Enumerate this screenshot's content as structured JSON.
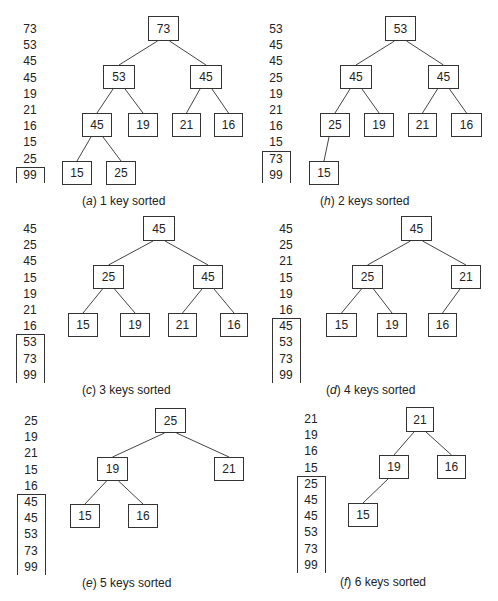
{
  "figure": {
    "panels": [
      {
        "id": "a",
        "caption_label": "(a)",
        "caption_text": "1 key sorted",
        "array": [
          "73",
          "53",
          "45",
          "45",
          "19",
          "21",
          "16",
          "15",
          "25",
          "99"
        ],
        "sorted_count": 1,
        "tree": [
          {
            "v": "73",
            "x": 148,
            "y": 16,
            "w": 31,
            "h": 25
          },
          {
            "v": "53",
            "x": 103,
            "y": 65,
            "w": 32,
            "h": 24
          },
          {
            "v": "45",
            "x": 190,
            "y": 65,
            "w": 32,
            "h": 24
          },
          {
            "v": "45",
            "x": 82,
            "y": 113,
            "w": 30,
            "h": 24
          },
          {
            "v": "19",
            "x": 128,
            "y": 113,
            "w": 30,
            "h": 24
          },
          {
            "v": "21",
            "x": 172,
            "y": 113,
            "w": 29,
            "h": 24
          },
          {
            "v": "16",
            "x": 214,
            "y": 113,
            "w": 29,
            "h": 24
          },
          {
            "v": "15",
            "x": 62,
            "y": 161,
            "w": 30,
            "h": 24
          },
          {
            "v": "25",
            "x": 106,
            "y": 161,
            "w": 30,
            "h": 24
          }
        ],
        "edges": [
          [
            0,
            1
          ],
          [
            0,
            2
          ],
          [
            1,
            3
          ],
          [
            1,
            4
          ],
          [
            2,
            5
          ],
          [
            2,
            6
          ],
          [
            3,
            7
          ],
          [
            3,
            8
          ]
        ]
      },
      {
        "id": "b",
        "caption_label": "(h)",
        "caption_text": "2 keys sorted",
        "array": [
          "53",
          "45",
          "45",
          "25",
          "19",
          "21",
          "16",
          "15",
          "73",
          "99"
        ],
        "sorted_count": 2,
        "tree": [
          {
            "v": "53",
            "x": 385,
            "y": 16,
            "w": 31,
            "h": 25
          },
          {
            "v": "45",
            "x": 340,
            "y": 65,
            "w": 32,
            "h": 24
          },
          {
            "v": "45",
            "x": 428,
            "y": 65,
            "w": 31,
            "h": 24
          },
          {
            "v": "25",
            "x": 320,
            "y": 113,
            "w": 30,
            "h": 24
          },
          {
            "v": "19",
            "x": 364,
            "y": 113,
            "w": 30,
            "h": 24
          },
          {
            "v": "21",
            "x": 408,
            "y": 113,
            "w": 29,
            "h": 24
          },
          {
            "v": "16",
            "x": 451,
            "y": 113,
            "w": 31,
            "h": 24
          },
          {
            "v": "15",
            "x": 309,
            "y": 161,
            "w": 30,
            "h": 24
          }
        ],
        "edges": [
          [
            0,
            1
          ],
          [
            0,
            2
          ],
          [
            1,
            3
          ],
          [
            1,
            4
          ],
          [
            2,
            5
          ],
          [
            2,
            6
          ],
          [
            3,
            7
          ]
        ]
      },
      {
        "id": "c",
        "caption_label": "(c)",
        "caption_text": "3 keys sorted",
        "array": [
          "45",
          "25",
          "45",
          "15",
          "19",
          "21",
          "16",
          "53",
          "73",
          "99"
        ],
        "sorted_count": 3,
        "tree": [
          {
            "v": "45",
            "x": 143,
            "y": 216,
            "w": 32,
            "h": 25
          },
          {
            "v": "25",
            "x": 93,
            "y": 265,
            "w": 31,
            "h": 24
          },
          {
            "v": "45",
            "x": 193,
            "y": 265,
            "w": 30,
            "h": 24
          },
          {
            "v": "15",
            "x": 68,
            "y": 313,
            "w": 30,
            "h": 24
          },
          {
            "v": "19",
            "x": 120,
            "y": 313,
            "w": 30,
            "h": 24
          },
          {
            "v": "21",
            "x": 168,
            "y": 313,
            "w": 29,
            "h": 24
          },
          {
            "v": "16",
            "x": 220,
            "y": 313,
            "w": 28,
            "h": 24
          }
        ],
        "edges": [
          [
            0,
            1
          ],
          [
            0,
            2
          ],
          [
            1,
            3
          ],
          [
            1,
            4
          ],
          [
            2,
            5
          ],
          [
            2,
            6
          ]
        ]
      },
      {
        "id": "d",
        "caption_label": "(d)",
        "caption_text": "4 keys sorted",
        "array": [
          "45",
          "25",
          "21",
          "15",
          "19",
          "16",
          "45",
          "53",
          "73",
          "99"
        ],
        "sorted_count": 4,
        "tree": [
          {
            "v": "45",
            "x": 401,
            "y": 216,
            "w": 31,
            "h": 25
          },
          {
            "v": "25",
            "x": 352,
            "y": 265,
            "w": 31,
            "h": 24
          },
          {
            "v": "21",
            "x": 451,
            "y": 265,
            "w": 30,
            "h": 24
          },
          {
            "v": "15",
            "x": 326,
            "y": 313,
            "w": 31,
            "h": 24
          },
          {
            "v": "19",
            "x": 377,
            "y": 313,
            "w": 30,
            "h": 24
          },
          {
            "v": "16",
            "x": 428,
            "y": 313,
            "w": 29,
            "h": 24
          }
        ],
        "edges": [
          [
            0,
            1
          ],
          [
            0,
            2
          ],
          [
            1,
            3
          ],
          [
            1,
            4
          ],
          [
            2,
            5
          ]
        ]
      },
      {
        "id": "e",
        "caption_label": "(e)",
        "caption_text": "5 keys sorted",
        "array": [
          "25",
          "19",
          "21",
          "15",
          "16",
          "45",
          "45",
          "53",
          "73",
          "99"
        ],
        "sorted_count": 5,
        "tree": [
          {
            "v": "25",
            "x": 155,
            "y": 408,
            "w": 31,
            "h": 25
          },
          {
            "v": "19",
            "x": 97,
            "y": 457,
            "w": 31,
            "h": 24
          },
          {
            "v": "21",
            "x": 214,
            "y": 457,
            "w": 30,
            "h": 24
          },
          {
            "v": "15",
            "x": 70,
            "y": 504,
            "w": 30,
            "h": 24
          },
          {
            "v": "16",
            "x": 128,
            "y": 504,
            "w": 30,
            "h": 24
          }
        ],
        "edges": [
          [
            0,
            1
          ],
          [
            0,
            2
          ],
          [
            1,
            3
          ],
          [
            1,
            4
          ]
        ]
      },
      {
        "id": "f",
        "caption_label": "(f)",
        "caption_text": "6 keys sorted",
        "array": [
          "21",
          "19",
          "16",
          "15",
          "25",
          "45",
          "45",
          "53",
          "73",
          "99"
        ],
        "sorted_count": 6,
        "tree": [
          {
            "v": "21",
            "x": 406,
            "y": 407,
            "w": 28,
            "h": 25
          },
          {
            "v": "19",
            "x": 379,
            "y": 455,
            "w": 30,
            "h": 24
          },
          {
            "v": "16",
            "x": 437,
            "y": 455,
            "w": 29,
            "h": 24
          },
          {
            "v": "15",
            "x": 348,
            "y": 503,
            "w": 30,
            "h": 24
          }
        ],
        "edges": [
          [
            0,
            1
          ],
          [
            0,
            2
          ],
          [
            1,
            3
          ]
        ]
      }
    ]
  },
  "layout": {
    "array_columns": [
      {
        "x": 16,
        "y0": 22
      },
      {
        "x": 262,
        "y0": 22
      },
      {
        "x": 16,
        "y0": 222
      },
      {
        "x": 272,
        "y0": 222
      },
      {
        "x": 17,
        "y0": 414
      },
      {
        "x": 297,
        "y0": 412
      }
    ],
    "row_step": 16.2,
    "captions": [
      {
        "x": 82,
        "y": 194
      },
      {
        "x": 320,
        "y": 194
      },
      {
        "x": 82,
        "y": 383
      },
      {
        "x": 326,
        "y": 383
      },
      {
        "x": 82,
        "y": 576
      },
      {
        "x": 340,
        "y": 575
      }
    ]
  }
}
